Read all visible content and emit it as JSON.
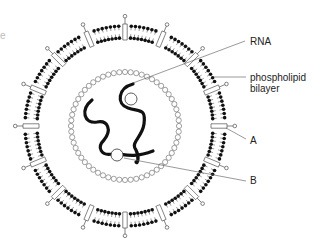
{
  "diagram": {
    "type": "virus cross-section",
    "fragment_text": "e",
    "labels": {
      "rna": "RNA",
      "phospholipid_line1": "phospholipid",
      "phospholipid_line2": "bilayer",
      "a": "A",
      "b": "B"
    },
    "colors": {
      "ink": "#111111",
      "line": "#555555",
      "background": "#ffffff"
    },
    "geometry": {
      "cx": 125,
      "cy": 126,
      "outer_radius": 100,
      "inner_radius": 88,
      "capsid_radius": 54,
      "spike_count": 16
    }
  }
}
